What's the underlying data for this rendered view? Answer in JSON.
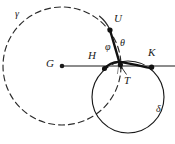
{
  "figure": {
    "background_color": "#ffffff",
    "stroke_color": "#1a1a1a",
    "line_color": "#8c8c8c"
  },
  "curves": {
    "gamma": {
      "label": "γ",
      "style": "dashed",
      "cx": 62,
      "cy": 66,
      "r": 59,
      "color": "#2b2b2b"
    },
    "delta": {
      "label": "δ",
      "style": "solid",
      "cx": 128,
      "cy": 97,
      "r": 36,
      "color": "#1a1a1a"
    },
    "arc_through_u": {
      "label": "arc-U",
      "style": "solid-thick",
      "color": "#111111"
    },
    "baseline": {
      "label": "horizontal-line-through-G",
      "style": "solid",
      "color": "#8c8c8c",
      "y": 66,
      "x_start": 62,
      "x_end": 175
    }
  },
  "points": [
    {
      "id": "G",
      "label": "G",
      "x": 62,
      "y": 66,
      "label_x": 46,
      "label_y": 59,
      "dot": true
    },
    {
      "id": "H",
      "label": "H",
      "x": 105,
      "y": 68,
      "label_x": 88,
      "label_y": 51,
      "dot": true
    },
    {
      "id": "T",
      "label": "T",
      "x": 120,
      "y": 65,
      "label_x": 124,
      "label_y": 76,
      "dot": true
    },
    {
      "id": "K",
      "label": "K",
      "x": 152,
      "y": 66,
      "label_x": 149,
      "label_y": 48,
      "dot": true
    },
    {
      "id": "U",
      "label": "U",
      "x": 110,
      "y": 30,
      "label_x": 114,
      "label_y": 14,
      "dot": true
    }
  ],
  "angles": [
    {
      "id": "phi",
      "label": "φ",
      "x": 107,
      "y": 46
    },
    {
      "id": "theta",
      "label": "θ",
      "x": 121,
      "y": 42
    }
  ],
  "curve_labels": [
    {
      "id": "gamma",
      "label": "γ",
      "x": 16,
      "y": 11
    },
    {
      "id": "delta",
      "label": "δ",
      "x": 157,
      "y": 106
    }
  ]
}
